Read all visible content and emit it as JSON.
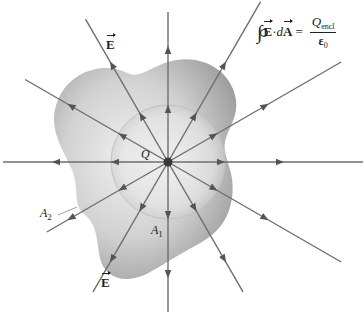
{
  "figure": {
    "colors": {
      "background": "#ffffff",
      "field_line": "#6e6e6e",
      "arrowhead": "#555555",
      "surface_light": "#ebebeb",
      "surface_dark": "#9a9a9a",
      "sphere_outline": "#bdbdbd",
      "charge": "#3a3a3a",
      "text": "#222222"
    },
    "charge": {
      "label": "Q",
      "x": 168,
      "y": 162,
      "radius": 5
    },
    "sphere": {
      "label": "A",
      "subscript": "1",
      "radius": 57
    },
    "irregular_surface": {
      "label": "A",
      "subscript": "2"
    },
    "field_label_top": "E",
    "field_label_bottom": "E",
    "field_lines": [
      {
        "angle_deg": 0,
        "length": 195
      },
      {
        "angle_deg": 30,
        "length": 200
      },
      {
        "angle_deg": 60,
        "length": 185
      },
      {
        "angle_deg": 90,
        "length": 150
      },
      {
        "angle_deg": 120,
        "length": 165
      },
      {
        "angle_deg": 150,
        "length": 165
      },
      {
        "angle_deg": 180,
        "length": 165
      },
      {
        "angle_deg": 210,
        "length": 140
      },
      {
        "angle_deg": 240,
        "length": 150
      },
      {
        "angle_deg": 270,
        "length": 150
      },
      {
        "angle_deg": 300,
        "length": 150
      },
      {
        "angle_deg": 330,
        "length": 200
      }
    ],
    "equation": {
      "integral_symbol": "∮",
      "lhs_E": "E",
      "dot": "·",
      "lhs_d": "d",
      "lhs_A": "A",
      "equals": "=",
      "numerator_Q": "Q",
      "numerator_sub": "encl",
      "denominator": "ε",
      "denominator_sub": "0"
    }
  }
}
